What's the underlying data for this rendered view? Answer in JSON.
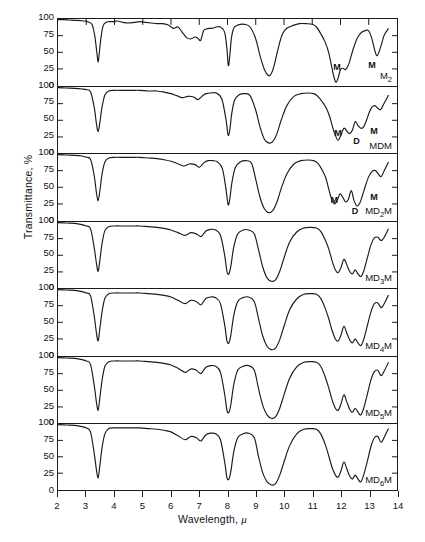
{
  "chart_data": {
    "type": "line",
    "title": "",
    "xlabel": "Wavelength, μ",
    "ylabel": "Transmittance, %",
    "xlim": [
      2,
      14
    ],
    "ylim": [
      0,
      100
    ],
    "xticks": [
      2,
      3,
      4,
      5,
      6,
      7,
      8,
      9,
      10,
      11,
      12,
      13,
      14
    ],
    "yticks": [
      0,
      25,
      50,
      75,
      100
    ],
    "grid": false,
    "legend": "none",
    "panel_count": 7,
    "series": [
      {
        "name": "M2",
        "label": "M₂",
        "annotations": [
          {
            "text": "M",
            "x": 11.82,
            "y": 27
          },
          {
            "text": "M",
            "x": 13.05,
            "y": 30
          }
        ],
        "x": [
          2.0,
          2.2,
          2.4,
          2.6,
          2.8,
          2.95,
          3.05,
          3.2,
          3.3,
          3.38,
          3.42,
          3.46,
          3.52,
          3.6,
          3.7,
          3.8,
          3.95,
          4.1,
          4.3,
          4.5,
          4.7,
          4.9,
          5.1,
          5.3,
          5.5,
          5.7,
          5.9,
          6.0,
          6.1,
          6.25,
          6.4,
          6.55,
          6.7,
          6.85,
          6.95,
          7.05,
          7.15,
          7.25,
          7.35,
          7.45,
          7.6,
          7.75,
          7.9,
          7.98,
          8.03,
          8.08,
          8.14,
          8.22,
          8.32,
          8.45,
          8.6,
          8.8,
          9.0,
          9.15,
          9.3,
          9.45,
          9.55,
          9.65,
          9.75,
          9.85,
          9.95,
          10.1,
          10.3,
          10.55,
          10.8,
          11.0,
          11.15,
          11.3,
          11.45,
          11.58,
          11.68,
          11.76,
          11.84,
          11.92,
          12.0,
          12.08,
          12.18,
          12.3,
          12.45,
          12.6,
          12.75,
          12.9,
          13.0,
          13.1,
          13.2,
          13.28,
          13.36,
          13.45,
          13.55,
          13.7
        ],
        "y": [
          99,
          99,
          98.5,
          98,
          97.5,
          97,
          96,
          92,
          75,
          48,
          35,
          48,
          72,
          90,
          95,
          96,
          96,
          97,
          95,
          94,
          95,
          96,
          95,
          94,
          93,
          93,
          91,
          88,
          86,
          88,
          80,
          72,
          70,
          73,
          71,
          68,
          82,
          85,
          86,
          86,
          88,
          88,
          80,
          55,
          30,
          44,
          72,
          86,
          90,
          92,
          92,
          88,
          70,
          45,
          25,
          15,
          18,
          30,
          48,
          65,
          78,
          86,
          90,
          93,
          93,
          92,
          88,
          78,
          66,
          50,
          30,
          14,
          5,
          12,
          24,
          26,
          24,
          33,
          55,
          72,
          80,
          83,
          82,
          72,
          55,
          45,
          50,
          62,
          76,
          86
        ]
      },
      {
        "name": "MDM",
        "label": "MDM",
        "annotations": [
          {
            "text": "M",
            "x": 11.85,
            "y": 30
          },
          {
            "text": "D",
            "x": 12.5,
            "y": 18
          },
          {
            "text": "M",
            "x": 13.12,
            "y": 33
          }
        ],
        "x": [
          2.0,
          2.3,
          2.6,
          2.85,
          3.0,
          3.15,
          3.28,
          3.36,
          3.42,
          3.48,
          3.56,
          3.66,
          3.8,
          4.0,
          4.3,
          4.6,
          4.9,
          5.2,
          5.5,
          5.8,
          6.0,
          6.2,
          6.4,
          6.6,
          6.8,
          6.95,
          7.05,
          7.15,
          7.25,
          7.4,
          7.6,
          7.8,
          7.95,
          8.02,
          8.08,
          8.15,
          8.25,
          8.4,
          8.6,
          8.8,
          9.0,
          9.15,
          9.3,
          9.45,
          9.6,
          9.75,
          9.9,
          10.1,
          10.35,
          10.6,
          10.85,
          11.05,
          11.2,
          11.35,
          11.5,
          11.62,
          11.72,
          11.82,
          11.92,
          12.02,
          12.12,
          12.22,
          12.32,
          12.42,
          12.52,
          12.62,
          12.72,
          12.82,
          12.92,
          13.02,
          13.12,
          13.22,
          13.32,
          13.42,
          13.55,
          13.7
        ],
        "y": [
          99,
          98.5,
          98,
          97,
          96,
          93,
          70,
          45,
          33,
          46,
          70,
          88,
          94,
          95,
          95,
          95,
          95,
          94,
          94,
          92,
          90,
          87,
          84,
          86,
          85,
          81,
          84,
          88,
          90,
          91,
          91,
          82,
          50,
          28,
          35,
          60,
          80,
          88,
          90,
          87,
          65,
          40,
          22,
          16,
          18,
          30,
          50,
          72,
          86,
          90,
          91,
          90,
          86,
          78,
          68,
          55,
          40,
          27,
          20,
          28,
          38,
          34,
          30,
          35,
          48,
          42,
          38,
          40,
          50,
          62,
          70,
          72,
          68,
          66,
          76,
          88
        ]
      },
      {
        "name": "MD2M",
        "label": "MD₂M",
        "annotations": [
          {
            "text": "M",
            "x": 11.72,
            "y": 31
          },
          {
            "text": "D",
            "x": 12.45,
            "y": 14
          },
          {
            "text": "M",
            "x": 13.12,
            "y": 35
          }
        ],
        "x": [
          2.0,
          2.3,
          2.6,
          2.85,
          3.0,
          3.15,
          3.28,
          3.36,
          3.42,
          3.48,
          3.56,
          3.66,
          3.8,
          4.0,
          4.3,
          4.6,
          4.9,
          5.2,
          5.5,
          5.8,
          6.0,
          6.2,
          6.45,
          6.65,
          6.85,
          7.0,
          7.1,
          7.2,
          7.32,
          7.48,
          7.65,
          7.82,
          7.95,
          8.02,
          8.08,
          8.16,
          8.28,
          8.45,
          8.65,
          8.85,
          9.0,
          9.15,
          9.3,
          9.45,
          9.6,
          9.75,
          9.9,
          10.1,
          10.35,
          10.6,
          10.85,
          11.05,
          11.2,
          11.35,
          11.48,
          11.58,
          11.68,
          11.78,
          11.88,
          11.98,
          12.08,
          12.18,
          12.28,
          12.38,
          12.48,
          12.58,
          12.68,
          12.78,
          12.88,
          13.0,
          13.12,
          13.24,
          13.34,
          13.44,
          13.56,
          13.7
        ],
        "y": [
          99,
          98.5,
          98,
          97,
          95,
          92,
          68,
          42,
          30,
          44,
          70,
          88,
          94,
          95,
          95,
          95,
          95,
          94,
          93,
          91,
          89,
          86,
          82,
          85,
          84,
          80,
          84,
          88,
          90,
          90,
          88,
          78,
          46,
          24,
          32,
          58,
          80,
          88,
          90,
          86,
          62,
          35,
          18,
          12,
          15,
          28,
          48,
          70,
          85,
          90,
          91,
          90,
          86,
          76,
          64,
          48,
          33,
          25,
          30,
          40,
          35,
          28,
          32,
          45,
          30,
          22,
          26,
          38,
          52,
          66,
          74,
          75,
          70,
          66,
          76,
          88
        ]
      },
      {
        "name": "MD3M",
        "label": "MD₃M",
        "annotations": [],
        "x": [
          2.0,
          2.3,
          2.6,
          2.85,
          3.0,
          3.15,
          3.28,
          3.36,
          3.42,
          3.48,
          3.56,
          3.66,
          3.8,
          4.0,
          4.3,
          4.6,
          4.9,
          5.2,
          5.5,
          5.8,
          6.0,
          6.25,
          6.5,
          6.7,
          6.9,
          7.05,
          7.15,
          7.25,
          7.4,
          7.58,
          7.75,
          7.9,
          7.98,
          8.05,
          8.12,
          8.22,
          8.36,
          8.55,
          8.75,
          8.95,
          9.1,
          9.25,
          9.4,
          9.55,
          9.7,
          9.85,
          10.0,
          10.2,
          10.45,
          10.7,
          10.95,
          11.15,
          11.3,
          11.45,
          11.58,
          11.7,
          11.82,
          11.92,
          12.02,
          12.12,
          12.22,
          12.32,
          12.42,
          12.52,
          12.62,
          12.72,
          12.82,
          12.95,
          13.08,
          13.2,
          13.32,
          13.44,
          13.56,
          13.7
        ],
        "y": [
          99,
          98.5,
          98,
          96,
          94,
          90,
          62,
          38,
          26,
          42,
          68,
          87,
          93,
          94,
          94,
          94,
          94,
          93,
          92,
          90,
          88,
          84,
          80,
          84,
          82,
          78,
          82,
          87,
          89,
          88,
          80,
          50,
          26,
          22,
          34,
          62,
          82,
          88,
          88,
          82,
          58,
          32,
          16,
          11,
          13,
          26,
          46,
          70,
          85,
          91,
          92,
          91,
          86,
          74,
          60,
          42,
          28,
          24,
          32,
          44,
          36,
          26,
          22,
          28,
          22,
          18,
          26,
          46,
          66,
          76,
          77,
          72,
          78,
          90
        ]
      },
      {
        "name": "MD4M",
        "label": "MD₄M",
        "annotations": [],
        "x": [
          2.0,
          2.3,
          2.6,
          2.85,
          3.0,
          3.15,
          3.28,
          3.36,
          3.42,
          3.48,
          3.56,
          3.66,
          3.8,
          4.0,
          4.3,
          4.6,
          4.9,
          5.2,
          5.5,
          5.8,
          6.0,
          6.25,
          6.5,
          6.7,
          6.9,
          7.05,
          7.15,
          7.25,
          7.4,
          7.58,
          7.75,
          7.9,
          7.98,
          8.05,
          8.12,
          8.22,
          8.36,
          8.55,
          8.75,
          8.95,
          9.1,
          9.25,
          9.4,
          9.55,
          9.7,
          9.85,
          10.0,
          10.2,
          10.45,
          10.7,
          10.95,
          11.15,
          11.3,
          11.45,
          11.58,
          11.7,
          11.82,
          11.92,
          12.02,
          12.12,
          12.22,
          12.32,
          12.42,
          12.52,
          12.62,
          12.72,
          12.82,
          12.95,
          13.08,
          13.2,
          13.32,
          13.44,
          13.56,
          13.7
        ],
        "y": [
          99,
          98.5,
          98,
          96,
          94,
          90,
          60,
          34,
          22,
          40,
          66,
          86,
          93,
          94,
          94,
          94,
          94,
          93,
          92,
          90,
          88,
          83,
          78,
          83,
          81,
          76,
          81,
          86,
          88,
          87,
          78,
          46,
          22,
          19,
          31,
          60,
          81,
          87,
          88,
          81,
          55,
          29,
          14,
          9,
          11,
          24,
          44,
          69,
          85,
          92,
          93,
          92,
          86,
          72,
          56,
          38,
          25,
          22,
          31,
          44,
          34,
          24,
          19,
          25,
          19,
          15,
          24,
          45,
          66,
          78,
          79,
          72,
          79,
          91
        ]
      },
      {
        "name": "MD5M",
        "label": "MD₅M",
        "annotations": [],
        "x": [
          2.0,
          2.3,
          2.6,
          2.85,
          3.0,
          3.15,
          3.28,
          3.36,
          3.42,
          3.48,
          3.56,
          3.66,
          3.8,
          4.0,
          4.3,
          4.6,
          4.9,
          5.2,
          5.5,
          5.8,
          6.0,
          6.25,
          6.5,
          6.7,
          6.9,
          7.05,
          7.15,
          7.25,
          7.4,
          7.58,
          7.75,
          7.9,
          7.98,
          8.05,
          8.12,
          8.22,
          8.36,
          8.55,
          8.75,
          8.95,
          9.1,
          9.25,
          9.4,
          9.55,
          9.7,
          9.85,
          10.0,
          10.2,
          10.45,
          10.7,
          10.95,
          11.15,
          11.3,
          11.45,
          11.58,
          11.7,
          11.82,
          11.92,
          12.02,
          12.12,
          12.22,
          12.32,
          12.42,
          12.52,
          12.62,
          12.72,
          12.82,
          12.95,
          13.08,
          13.2,
          13.32,
          13.44,
          13.56,
          13.7
        ],
        "y": [
          99,
          98.5,
          98,
          96,
          94,
          89,
          58,
          32,
          20,
          38,
          65,
          86,
          93,
          94,
          94,
          94,
          94,
          93,
          92,
          90,
          88,
          83,
          77,
          82,
          80,
          75,
          80,
          85,
          87,
          86,
          77,
          44,
          20,
          17,
          29,
          58,
          80,
          86,
          87,
          80,
          52,
          27,
          13,
          8,
          10,
          23,
          43,
          68,
          85,
          92,
          93,
          92,
          86,
          71,
          54,
          36,
          23,
          20,
          30,
          43,
          33,
          22,
          17,
          23,
          17,
          13,
          23,
          44,
          66,
          78,
          80,
          72,
          80,
          92
        ]
      },
      {
        "name": "MD6M",
        "label": "MD₆M",
        "annotations": [],
        "x": [
          2.0,
          2.3,
          2.6,
          2.85,
          3.0,
          3.15,
          3.28,
          3.36,
          3.42,
          3.48,
          3.56,
          3.66,
          3.8,
          4.0,
          4.3,
          4.6,
          4.9,
          5.2,
          5.5,
          5.8,
          6.0,
          6.25,
          6.5,
          6.7,
          6.9,
          7.05,
          7.15,
          7.25,
          7.4,
          7.58,
          7.75,
          7.9,
          7.98,
          8.05,
          8.12,
          8.22,
          8.36,
          8.55,
          8.75,
          8.95,
          9.1,
          9.25,
          9.4,
          9.55,
          9.7,
          9.85,
          10.0,
          10.2,
          10.45,
          10.7,
          10.95,
          11.15,
          11.3,
          11.45,
          11.58,
          11.7,
          11.82,
          11.92,
          12.02,
          12.12,
          12.22,
          12.32,
          12.42,
          12.52,
          12.62,
          12.72,
          12.82,
          12.95,
          13.08,
          13.2,
          13.32,
          13.44,
          13.56,
          13.7
        ],
        "y": [
          99,
          98.5,
          98,
          96,
          94,
          88,
          56,
          30,
          18,
          36,
          64,
          85,
          93,
          94,
          94,
          94,
          94,
          93,
          92,
          90,
          88,
          82,
          76,
          81,
          79,
          74,
          79,
          84,
          86,
          85,
          76,
          42,
          18,
          16,
          28,
          57,
          79,
          85,
          86,
          79,
          50,
          25,
          12,
          7,
          9,
          22,
          42,
          67,
          85,
          92,
          93,
          92,
          85,
          70,
          52,
          34,
          22,
          19,
          29,
          42,
          32,
          21,
          16,
          22,
          16,
          12,
          22,
          43,
          66,
          79,
          81,
          72,
          81,
          93
        ]
      }
    ]
  },
  "axis": {
    "y_tick_labels": [
      "100",
      "75",
      "50",
      "25",
      "0"
    ],
    "x_tick_labels": [
      "2",
      "3",
      "4",
      "5",
      "6",
      "7",
      "8",
      "9",
      "10",
      "11",
      "12",
      "13",
      "14"
    ],
    "x_title": "Wavelength, ",
    "x_title_unit": "μ",
    "y_title": "Transmittance, %"
  },
  "style": {
    "line_color": "#1a1a1a",
    "axis_color": "#1a1a1a",
    "background": "#ffffff"
  }
}
